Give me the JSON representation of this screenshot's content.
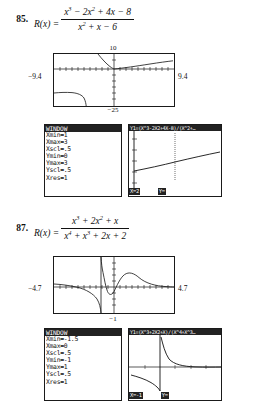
{
  "problems": [
    {
      "number": "85.",
      "fn_label": "R(x) =",
      "numerator": "x³ − 2x² + 4x − 8",
      "numerator_parts": [
        {
          "t": "x",
          "sup": "3"
        },
        {
          "t": " − 2x",
          "sup": "2"
        },
        {
          "t": " + 4x − 8",
          "sup": ""
        }
      ],
      "denominator_parts": [
        {
          "t": "x",
          "sup": "2"
        },
        {
          "t": " + x − 6",
          "sup": ""
        }
      ],
      "graph": {
        "top_label": "10",
        "bottom_label": "−25",
        "left_label": "−9.4",
        "right_label": "9.4",
        "xmin": -9.4,
        "xmax": 9.4,
        "ymin": -25,
        "ymax": 10
      },
      "window_screen": {
        "title": "WINDOW",
        "lines": [
          "Xmin=1",
          "Xmax=3",
          "Xscl=.5",
          "Ymin=0",
          "Ymax=3",
          "Yscl=.5",
          "Xres=1"
        ]
      },
      "trace_screen": {
        "equation": "Y1=(X^3-2X2+4X-8)/(X^2+…",
        "x_readout": "X=2",
        "y_readout": "Y=",
        "xmin": 1,
        "xmax": 3,
        "ymin": 0,
        "ymax": 3
      }
    },
    {
      "number": "87.",
      "fn_label": "R(x) =",
      "numerator_parts": [
        {
          "t": "x",
          "sup": "3"
        },
        {
          "t": " + 2x",
          "sup": "2"
        },
        {
          "t": " + x",
          "sup": ""
        }
      ],
      "denominator_parts": [
        {
          "t": "x",
          "sup": "4"
        },
        {
          "t": " + x",
          "sup": "3"
        },
        {
          "t": " + 2x + 2",
          "sup": ""
        }
      ],
      "graph": {
        "top_label": "",
        "bottom_label": "−1",
        "left_label": "−4.7",
        "right_label": "4.7",
        "xmin": -4.7,
        "xmax": 4.7,
        "ymin": -1,
        "ymax": 1
      },
      "window_screen": {
        "title": "WINDOW",
        "lines": [
          "Xmin=-1.5",
          "Xmax=0",
          "Xscl=.5",
          "Ymin=-1",
          "Ymax=1",
          "Yscl=.5",
          "Xres=1"
        ]
      },
      "trace_screen": {
        "equation": "Y1=(X^3+2X2+X)/(X^4+X^3…",
        "x_readout": "X=-1",
        "y_readout": "Y=",
        "xmin": -1.5,
        "xmax": 0,
        "ymin": -1,
        "ymax": 1
      }
    }
  ],
  "colors": {
    "ink": "#111111",
    "screen_border": "#1a1a1a",
    "calc_bar": "#222222",
    "page_bg": "#ffffff"
  }
}
